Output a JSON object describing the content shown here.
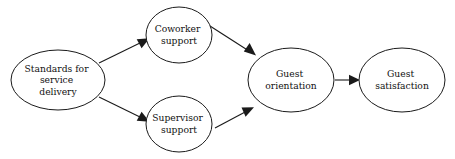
{
  "diagram": {
    "type": "flow-diagram",
    "title": "",
    "background_color": "#ffffff",
    "line_color": "#1a1a1a",
    "text_color": "#111111",
    "nodes": [
      {
        "id": "standards",
        "label": "Standards for service delivery",
        "lines": [
          "Standards for",
          "service",
          "delivery"
        ],
        "shape": "ellipse",
        "cx": 58,
        "cy": 80,
        "rx": 47,
        "ry": 30
      },
      {
        "id": "coworker",
        "label": "Coworker support",
        "lines": [
          "Coworker",
          "support"
        ],
        "shape": "circle",
        "cx": 179,
        "cy": 35,
        "rx": 33,
        "ry": 28
      },
      {
        "id": "supervisor",
        "label": "Supervisor support",
        "lines": [
          "Supervisor",
          "support"
        ],
        "shape": "circle",
        "cx": 179,
        "cy": 124,
        "rx": 33,
        "ry": 28
      },
      {
        "id": "orientation",
        "label": "Guest orientation",
        "lines": [
          "Guest",
          "orientation"
        ],
        "shape": "ellipse",
        "cx": 291,
        "cy": 80,
        "rx": 43,
        "ry": 32
      },
      {
        "id": "satisfaction",
        "label": "Guest satisfaction",
        "lines": [
          "Guest",
          "satisfaction"
        ],
        "shape": "ellipse",
        "cx": 402,
        "cy": 80,
        "rx": 43,
        "ry": 32
      }
    ],
    "edges": [
      {
        "id": "standards-to-coworker",
        "from": "standards",
        "to": "coworker",
        "label": "",
        "arrow": "single"
      },
      {
        "id": "standards-to-supervisor",
        "from": "standards",
        "to": "supervisor",
        "label": "",
        "arrow": "single"
      },
      {
        "id": "coworker-to-orientation",
        "from": "coworker",
        "to": "orientation",
        "label": "",
        "arrow": "single"
      },
      {
        "id": "supervisor-to-orientation",
        "from": "supervisor",
        "to": "orientation",
        "label": "",
        "arrow": "single"
      },
      {
        "id": "orientation-to-satisfaction",
        "from": "orientation",
        "to": "satisfaction",
        "label": "",
        "arrow": "single"
      }
    ]
  }
}
